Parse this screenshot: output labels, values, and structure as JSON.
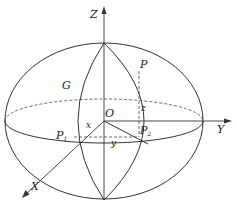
{
  "figure": {
    "type": "ellipsoid-coordinate-diagram",
    "axes": {
      "z": "Z",
      "y": "Y",
      "x": "X"
    },
    "origin": "O",
    "meridian": "G",
    "points": {
      "P": "P",
      "P1": {
        "main": "P",
        "sub": "1"
      },
      "P2": {
        "main": "P",
        "sub": "2"
      }
    },
    "coords": {
      "x": "x",
      "y": "y",
      "z": "z"
    }
  }
}
